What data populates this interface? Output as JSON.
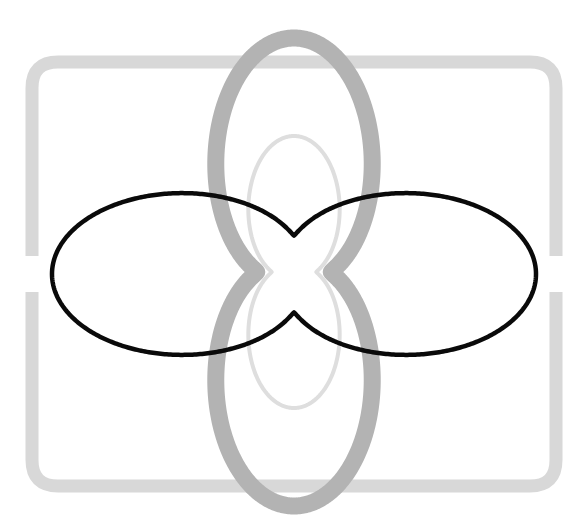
{
  "canvas": {
    "width": 588,
    "height": 528,
    "background_color": "#ffffff",
    "title": "Nested rosette curves with rounded frame"
  },
  "chart_data": {
    "type": "line",
    "title": "Nested rosette curves with rounded frame",
    "subtitle": "",
    "xlabel": "",
    "ylabel": "",
    "xlim": [
      0,
      588
    ],
    "ylim": [
      0,
      528
    ],
    "grid": false,
    "legend_position": "none",
    "tick_labels_x": [],
    "tick_labels_y": [],
    "annotations": [],
    "series": [
      {
        "name": "outer-horizontal-rosette",
        "render": "closed-curve",
        "color": "#0a0a0a",
        "stroke_width": 4.5,
        "opacity": 1,
        "orientation": "horizontal",
        "center": [
          294,
          274
        ],
        "radius_max": 242,
        "radius_min": 62,
        "lobes": 2,
        "extent_x": [
          52,
          536
        ],
        "extent_y": [
          140,
          410
        ],
        "waist_top_y": 212,
        "waist_bottom_y": 336
      },
      {
        "name": "middle-vertical-rosette",
        "render": "closed-curve",
        "color": "#b3b3b3",
        "stroke_width": 17,
        "opacity": 1,
        "orientation": "vertical",
        "center": [
          294,
          272
        ],
        "radius_max": 234,
        "radius_min": 60,
        "lobes": 2,
        "extent_x": [
          176,
          412
        ],
        "extent_y": [
          38,
          506
        ],
        "waist_left_x": 234,
        "waist_right_x": 354
      },
      {
        "name": "inner-vertical-rosette",
        "render": "closed-curve",
        "color": "#dedede",
        "stroke_width": 4,
        "opacity": 1,
        "orientation": "vertical",
        "center": [
          294,
          272
        ],
        "radius_max": 136,
        "radius_min": 36,
        "lobes": 2,
        "extent_x": [
          258,
          330
        ],
        "extent_y": [
          136,
          408
        ],
        "waist_left_x": 276,
        "waist_right_x": 312
      }
    ],
    "frame": {
      "name": "rounded-square-frame",
      "color": "#d8d8d8",
      "stroke_width": 13,
      "x": 32,
      "y": 62,
      "width": 524,
      "height": 424,
      "corner_radius": 26,
      "gap_side": "left-and-right",
      "gap_y_start": 256,
      "gap_y_end": 292
    },
    "colors": {
      "outer_curve": "#0a0a0a",
      "middle_curve": "#b3b3b3",
      "inner_curve": "#dedede",
      "frame": "#d8d8d8",
      "background": "#ffffff"
    }
  }
}
